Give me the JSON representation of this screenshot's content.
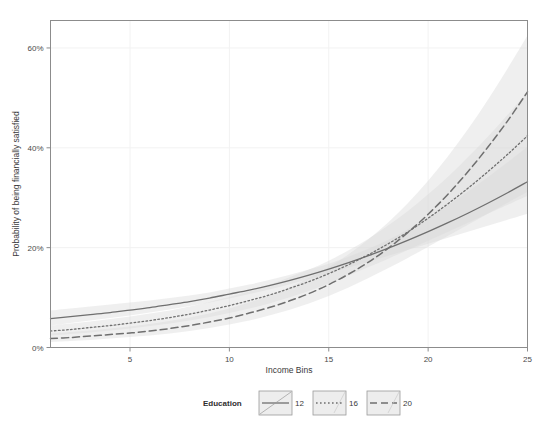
{
  "chart_data": {
    "type": "line",
    "title": "",
    "subtitle": "",
    "xlabel": "Income Bins",
    "ylabel": "Probability of being financially satisfied",
    "xlim": [
      1,
      25
    ],
    "ylim": [
      0,
      0.655
    ],
    "grid": true,
    "legend_position": "bottom-outside",
    "legend_title": "Education",
    "x_ticks": [
      5,
      10,
      15,
      20,
      25
    ],
    "x_tick_labels": [
      "5",
      "10",
      "15",
      "20",
      "25"
    ],
    "y_ticks": [
      0,
      0.2,
      0.4,
      0.6
    ],
    "y_tick_labels": [
      "0%",
      "20%",
      "40%",
      "60%"
    ],
    "x": [
      1,
      2,
      3,
      4,
      5,
      6,
      7,
      8,
      9,
      10,
      11,
      12,
      13,
      14,
      15,
      16,
      17,
      18,
      19,
      20,
      21,
      22,
      23,
      24,
      25
    ],
    "series": [
      {
        "name": "12",
        "label": "12",
        "style": "solid",
        "color": "#6f6f6f",
        "values": [
          0.058,
          0.062,
          0.066,
          0.07,
          0.075,
          0.08,
          0.086,
          0.092,
          0.099,
          0.107,
          0.115,
          0.124,
          0.134,
          0.145,
          0.157,
          0.17,
          0.184,
          0.199,
          0.215,
          0.232,
          0.25,
          0.269,
          0.289,
          0.31,
          0.332
        ],
        "ci_lower": [
          0.044,
          0.049,
          0.054,
          0.059,
          0.064,
          0.07,
          0.076,
          0.083,
          0.09,
          0.098,
          0.107,
          0.116,
          0.126,
          0.137,
          0.148,
          0.16,
          0.172,
          0.184,
          0.196,
          0.208,
          0.22,
          0.232,
          0.244,
          0.256,
          0.268
        ],
        "ci_upper": [
          0.074,
          0.078,
          0.082,
          0.086,
          0.09,
          0.094,
          0.099,
          0.104,
          0.11,
          0.118,
          0.126,
          0.135,
          0.145,
          0.156,
          0.168,
          0.182,
          0.198,
          0.216,
          0.237,
          0.26,
          0.285,
          0.312,
          0.341,
          0.371,
          0.402
        ]
      },
      {
        "name": "16",
        "label": "16",
        "style": "dotted",
        "color": "#6f6f6f",
        "values": [
          0.033,
          0.036,
          0.04,
          0.044,
          0.049,
          0.054,
          0.06,
          0.067,
          0.075,
          0.084,
          0.094,
          0.105,
          0.118,
          0.132,
          0.148,
          0.166,
          0.186,
          0.208,
          0.232,
          0.259,
          0.288,
          0.319,
          0.352,
          0.387,
          0.424
        ],
        "ci_lower": [
          0.024,
          0.027,
          0.03,
          0.034,
          0.038,
          0.043,
          0.048,
          0.054,
          0.061,
          0.069,
          0.078,
          0.088,
          0.1,
          0.113,
          0.128,
          0.144,
          0.161,
          0.178,
          0.196,
          0.214,
          0.232,
          0.25,
          0.268,
          0.286,
          0.304
        ],
        "ci_upper": [
          0.044,
          0.048,
          0.052,
          0.057,
          0.062,
          0.068,
          0.074,
          0.082,
          0.091,
          0.101,
          0.112,
          0.125,
          0.14,
          0.156,
          0.174,
          0.195,
          0.218,
          0.245,
          0.274,
          0.307,
          0.342,
          0.381,
          0.422,
          0.466,
          0.512
        ]
      },
      {
        "name": "20",
        "label": "20",
        "style": "dashed",
        "color": "#6f6f6f",
        "values": [
          0.018,
          0.02,
          0.023,
          0.026,
          0.029,
          0.033,
          0.038,
          0.044,
          0.051,
          0.059,
          0.069,
          0.08,
          0.093,
          0.108,
          0.126,
          0.147,
          0.171,
          0.199,
          0.231,
          0.267,
          0.307,
          0.352,
          0.401,
          0.454,
          0.512
        ],
        "ci_lower": [
          0.011,
          0.013,
          0.015,
          0.018,
          0.021,
          0.024,
          0.028,
          0.033,
          0.039,
          0.046,
          0.054,
          0.064,
          0.075,
          0.088,
          0.103,
          0.12,
          0.139,
          0.159,
          0.18,
          0.202,
          0.224,
          0.246,
          0.268,
          0.29,
          0.312
        ],
        "ci_upper": [
          0.028,
          0.031,
          0.034,
          0.038,
          0.042,
          0.047,
          0.053,
          0.06,
          0.068,
          0.078,
          0.09,
          0.104,
          0.12,
          0.139,
          0.161,
          0.187,
          0.217,
          0.251,
          0.29,
          0.334,
          0.383,
          0.437,
          0.496,
          0.559,
          0.625
        ]
      }
    ],
    "band_color": "#d9d9d9",
    "band_opacity": 0.42,
    "annotations": []
  },
  "legend": {
    "title": "Education",
    "entries": [
      {
        "label": "12",
        "style": "solid"
      },
      {
        "label": "16",
        "style": "dotted"
      },
      {
        "label": "20",
        "style": "dashed"
      }
    ]
  }
}
